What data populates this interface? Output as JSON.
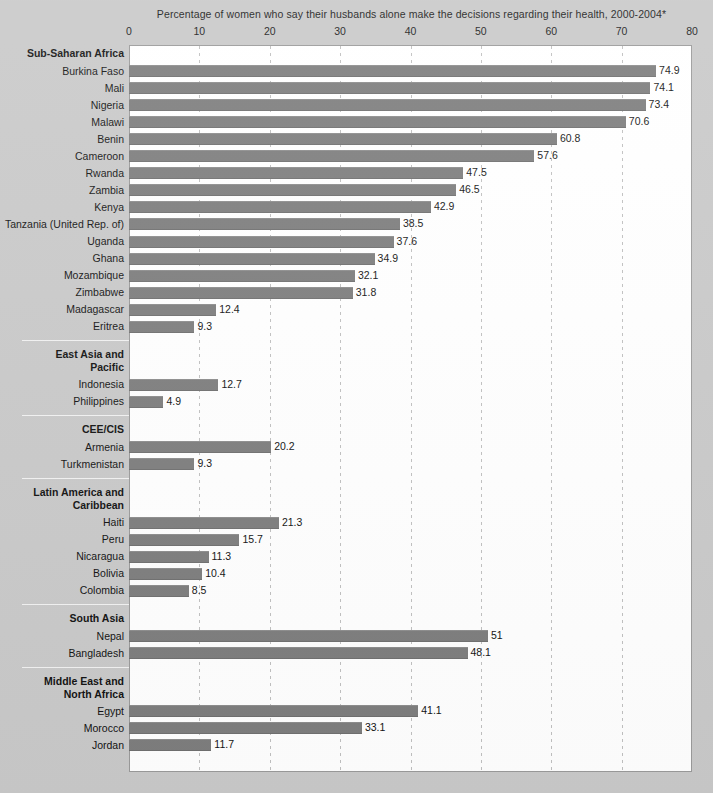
{
  "chart_data": {
    "type": "bar",
    "orientation": "horizontal",
    "title": "Percentage of women who say their husbands alone make the decisions regarding their health, 2000-2004*",
    "xlabel": "",
    "ylabel": "",
    "xlim": [
      0,
      80
    ],
    "xticks": [
      0,
      10,
      20,
      30,
      40,
      50,
      60,
      70,
      80
    ],
    "xtick_labels": [
      "0",
      "10",
      "20",
      "30",
      "40",
      "50",
      "60",
      "70",
      "80"
    ],
    "grid": true,
    "grid_axis": "x",
    "grid_style": "dashed",
    "legend": false,
    "bar_color": "#7d7d7d",
    "plot_background": "#ffffff",
    "page_background": "#c9c9c9",
    "groups": [
      {
        "name": "Sub-Saharan Africa",
        "categories": [
          "Burkina Faso",
          "Mali",
          "Nigeria",
          "Malawi",
          "Benin",
          "Cameroon",
          "Rwanda",
          "Zambia",
          "Kenya",
          "Tanzania (United Rep. of)",
          "Uganda",
          "Ghana",
          "Mozambique",
          "Zimbabwe",
          "Madagascar",
          "Eritrea"
        ],
        "values": [
          74.9,
          74.1,
          73.4,
          70.6,
          60.8,
          57.6,
          47.5,
          46.5,
          42.9,
          38.5,
          37.6,
          34.9,
          32.1,
          31.8,
          12.4,
          9.3
        ],
        "value_labels": [
          "74.9",
          "74.1",
          "73.4",
          "70.6",
          "60.8",
          "57.6",
          "47.5",
          "46.5",
          "42.9",
          "38.5",
          "37.6",
          "34.9",
          "32.1",
          "31.8",
          "12.4",
          "9.3"
        ]
      },
      {
        "name": "East Asia and Pacific",
        "name_lines": [
          "East Asia and",
          "Pacific"
        ],
        "categories": [
          "Indonesia",
          "Philippines"
        ],
        "values": [
          12.7,
          4.9
        ],
        "value_labels": [
          "12.7",
          "4.9"
        ]
      },
      {
        "name": "CEE/CIS",
        "name_lines": [
          "CEE/CIS"
        ],
        "categories": [
          "Armenia",
          "Turkmenistan"
        ],
        "values": [
          20.2,
          9.3
        ],
        "value_labels": [
          "20.2",
          "9.3"
        ]
      },
      {
        "name": "Latin America and Caribbean",
        "name_lines": [
          "Latin America and",
          "Caribbean"
        ],
        "categories": [
          "Haiti",
          "Peru",
          "Nicaragua",
          "Bolivia",
          "Colombia"
        ],
        "values": [
          21.3,
          15.7,
          11.3,
          10.4,
          8.5
        ],
        "value_labels": [
          "21.3",
          "15.7",
          "11.3",
          "10.4",
          "8.5"
        ]
      },
      {
        "name": "South Asia",
        "name_lines": [
          "South Asia"
        ],
        "categories": [
          "Nepal",
          "Bangladesh"
        ],
        "values": [
          51,
          48.1
        ],
        "value_labels": [
          "51",
          "48.1"
        ]
      },
      {
        "name": "Middle East and North Africa",
        "name_lines": [
          "Middle East and",
          "North Africa"
        ],
        "categories": [
          "Egypt",
          "Morocco",
          "Jordan"
        ],
        "values": [
          41.1,
          33.1,
          11.7
        ],
        "value_labels": [
          "41.1",
          "33.1",
          "11.7"
        ]
      }
    ]
  }
}
